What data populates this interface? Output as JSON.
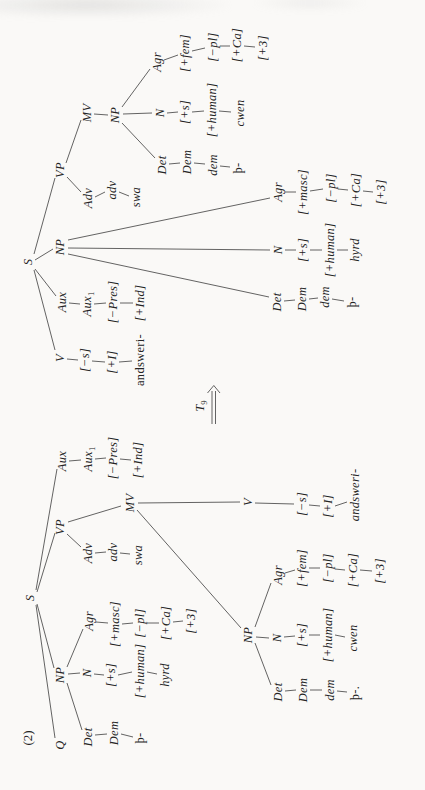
{
  "figure": {
    "example_label": "(2)",
    "transform": {
      "base": "T",
      "sub": "9"
    },
    "colors": {
      "ink": "#242424",
      "line": "#3c3c3c",
      "paper": "#faf9f7"
    }
  },
  "tree1": {
    "nodes": [
      {
        "t": "S",
        "x": 192,
        "y": 30
      },
      {
        "t": "Q",
        "x": 45,
        "y": 60
      },
      {
        "t": "NP",
        "x": 115,
        "y": 60
      },
      {
        "t": "VP",
        "x": 263,
        "y": 60
      },
      {
        "t": "Aux",
        "x": 329,
        "y": 62
      },
      {
        "t": "Aux",
        "sub": "1",
        "x": 331,
        "y": 88
      },
      {
        "t": "[−Pres]",
        "x": 332,
        "y": 113
      },
      {
        "t": "[+Ind]",
        "x": 330,
        "y": 138
      },
      {
        "t": "Det",
        "x": 53,
        "y": 88
      },
      {
        "t": "Dem",
        "x": 57,
        "y": 114
      },
      {
        "t": "þ-",
        "f": "rm",
        "x": 52,
        "y": 140
      },
      {
        "t": "N",
        "x": 117,
        "y": 87
      },
      {
        "t": "[+s]",
        "x": 115,
        "y": 111
      },
      {
        "t": "[+human]",
        "x": 119,
        "y": 140
      },
      {
        "t": "hyrd",
        "x": 115,
        "y": 165
      },
      {
        "t": "Agr",
        "x": 169,
        "y": 89
      },
      {
        "t": "[+masc]",
        "x": 166,
        "y": 115
      },
      {
        "t": "[−pl]",
        "x": 167,
        "y": 140
      },
      {
        "t": "[+Ca]",
        "x": 167,
        "y": 166
      },
      {
        "t": "[+3]",
        "x": 169,
        "y": 191
      },
      {
        "t": "Adv",
        "x": 237,
        "y": 88
      },
      {
        "t": "adv",
        "x": 238,
        "y": 113
      },
      {
        "t": "swa",
        "x": 235,
        "y": 138
      },
      {
        "t": "MV",
        "x": 287,
        "y": 130
      },
      {
        "t": "NP",
        "x": 155,
        "y": 248
      },
      {
        "t": "V",
        "x": 288,
        "y": 248
      },
      {
        "t": "[−s]",
        "x": 286,
        "y": 302
      },
      {
        "t": "[+I]",
        "x": 284,
        "y": 328
      },
      {
        "t": "andsweri-",
        "x": 295,
        "y": 355
      },
      {
        "t": "Det",
        "x": 98,
        "y": 278
      },
      {
        "t": "Dem",
        "x": 100,
        "y": 303
      },
      {
        "t": "dem",
        "x": 100,
        "y": 330
      },
      {
        "t": "þ-.",
        "f": "rm",
        "x": 97,
        "y": 355
      },
      {
        "t": "N",
        "x": 152,
        "y": 277
      },
      {
        "t": "[+s]",
        "x": 155,
        "y": 302
      },
      {
        "t": "[+human]",
        "x": 155,
        "y": 328
      },
      {
        "t": "cwen",
        "x": 152,
        "y": 353
      },
      {
        "t": "Agr",
        "x": 215,
        "y": 278
      },
      {
        "t": "[+fem]",
        "x": 222,
        "y": 302
      },
      {
        "t": "[−pl]",
        "x": 222,
        "y": 328
      },
      {
        "t": "[+Ca]",
        "x": 220,
        "y": 353
      },
      {
        "t": "[+3]",
        "x": 219,
        "y": 380
      }
    ],
    "edges": [
      [
        185,
        36,
        52,
        55
      ],
      [
        186,
        37,
        122,
        54
      ],
      [
        198,
        37,
        257,
        55
      ],
      [
        200,
        36,
        321,
        57
      ],
      [
        107,
        67,
        60,
        82
      ],
      [
        116,
        68,
        117,
        80
      ],
      [
        123,
        67,
        161,
        83
      ],
      [
        55,
        95,
        56,
        107
      ],
      [
        56,
        121,
        53,
        133
      ],
      [
        116,
        94,
        115,
        104
      ],
      [
        115,
        118,
        118,
        132
      ],
      [
        118,
        147,
        116,
        157
      ],
      [
        168,
        96,
        167,
        108
      ],
      [
        166,
        122,
        167,
        133
      ],
      [
        167,
        147,
        167,
        159
      ],
      [
        168,
        173,
        169,
        183
      ],
      [
        256,
        67,
        243,
        81
      ],
      [
        268,
        68,
        284,
        121
      ],
      [
        237,
        95,
        238,
        106
      ],
      [
        237,
        120,
        236,
        130
      ],
      [
        329,
        69,
        330,
        81
      ],
      [
        331,
        95,
        332,
        106
      ],
      [
        331,
        120,
        330,
        131
      ],
      [
        280,
        137,
        162,
        241
      ],
      [
        287,
        138,
        288,
        240
      ],
      [
        147,
        255,
        105,
        271
      ],
      [
        153,
        256,
        152,
        269
      ],
      [
        163,
        255,
        207,
        271
      ],
      [
        99,
        285,
        100,
        296
      ],
      [
        100,
        310,
        100,
        322
      ],
      [
        99,
        337,
        98,
        347
      ],
      [
        153,
        284,
        154,
        295
      ],
      [
        155,
        309,
        155,
        320
      ],
      [
        155,
        335,
        153,
        345
      ],
      [
        217,
        285,
        220,
        295
      ],
      [
        222,
        309,
        222,
        320
      ],
      [
        221,
        335,
        220,
        345
      ],
      [
        220,
        360,
        219,
        372
      ],
      [
        287,
        255,
        286,
        294
      ],
      [
        285,
        309,
        284,
        320
      ],
      [
        284,
        335,
        288,
        347
      ]
    ]
  },
  "tree2": {
    "nodes": [
      {
        "t": "S",
        "x": 528,
        "y": 28
      },
      {
        "t": "V",
        "x": 432,
        "y": 60
      },
      {
        "t": "[−s]",
        "x": 430,
        "y": 85
      },
      {
        "t": "[+I]",
        "x": 428,
        "y": 112
      },
      {
        "t": "andsweri-",
        "f": "rm",
        "x": 430,
        "y": 140
      },
      {
        "t": "Aux",
        "x": 488,
        "y": 62
      },
      {
        "t": "Aux",
        "sub": "1",
        "x": 486,
        "y": 87
      },
      {
        "t": "[−Pres]",
        "x": 488,
        "y": 113
      },
      {
        "t": "[+Ind]",
        "x": 487,
        "y": 140
      },
      {
        "t": "NP",
        "x": 543,
        "y": 60
      },
      {
        "t": "VP",
        "x": 620,
        "y": 60
      },
      {
        "t": "Adv",
        "x": 592,
        "y": 88
      },
      {
        "t": "adv",
        "x": 600,
        "y": 112
      },
      {
        "t": "swa",
        "x": 593,
        "y": 136
      },
      {
        "t": "MV",
        "x": 677,
        "y": 87
      },
      {
        "t": "NP",
        "x": 675,
        "y": 115
      },
      {
        "t": "Det",
        "x": 625,
        "y": 162
      },
      {
        "t": "Dem",
        "x": 628,
        "y": 187
      },
      {
        "t": "dem",
        "x": 625,
        "y": 213
      },
      {
        "t": "þ-",
        "f": "rm",
        "x": 622,
        "y": 238
      },
      {
        "t": "N",
        "x": 677,
        "y": 160
      },
      {
        "t": "[+s]",
        "x": 678,
        "y": 185
      },
      {
        "t": "[+human]",
        "x": 680,
        "y": 212
      },
      {
        "t": "cwen",
        "x": 677,
        "y": 240
      },
      {
        "t": "Agr",
        "x": 728,
        "y": 157
      },
      {
        "t": "[+fem]",
        "x": 737,
        "y": 185
      },
      {
        "t": "[−pl]",
        "x": 743,
        "y": 213
      },
      {
        "t": "[+Ca]",
        "x": 745,
        "y": 237
      },
      {
        "t": "[+3]",
        "x": 742,
        "y": 263
      },
      {
        "t": "Det",
        "x": 488,
        "y": 277
      },
      {
        "t": "Dem",
        "x": 491,
        "y": 302
      },
      {
        "t": "dem",
        "x": 493,
        "y": 325
      },
      {
        "t": "þ-",
        "f": "rm",
        "x": 488,
        "y": 352
      },
      {
        "t": "N",
        "x": 540,
        "y": 278
      },
      {
        "t": "[+s]",
        "x": 540,
        "y": 303
      },
      {
        "t": "[+human]",
        "x": 540,
        "y": 330
      },
      {
        "t": "hyrd",
        "x": 540,
        "y": 355
      },
      {
        "t": "Agr",
        "x": 598,
        "y": 278
      },
      {
        "t": "[+masc]",
        "x": 598,
        "y": 303
      },
      {
        "t": "[−pl]",
        "x": 602,
        "y": 331
      },
      {
        "t": "[+Ca]",
        "x": 600,
        "y": 356
      },
      {
        "t": "[+3]",
        "x": 598,
        "y": 381
      }
    ],
    "edges": [
      [
        520,
        34,
        440,
        55
      ],
      [
        521,
        35,
        494,
        56
      ],
      [
        530,
        35,
        541,
        53
      ],
      [
        536,
        34,
        612,
        55
      ],
      [
        431,
        67,
        430,
        78
      ],
      [
        429,
        92,
        428,
        105
      ],
      [
        428,
        119,
        429,
        132
      ],
      [
        487,
        69,
        486,
        80
      ],
      [
        486,
        94,
        487,
        106
      ],
      [
        487,
        120,
        487,
        133
      ],
      [
        536,
        68,
        493,
        269
      ],
      [
        542,
        68,
        540,
        270
      ],
      [
        550,
        68,
        592,
        270
      ],
      [
        613,
        67,
        598,
        81
      ],
      [
        627,
        66,
        670,
        81
      ],
      [
        593,
        95,
        598,
        105
      ],
      [
        598,
        119,
        594,
        129
      ],
      [
        676,
        94,
        675,
        108
      ],
      [
        667,
        122,
        632,
        155
      ],
      [
        676,
        123,
        677,
        152
      ],
      [
        683,
        122,
        721,
        150
      ],
      [
        626,
        169,
        627,
        180
      ],
      [
        627,
        194,
        626,
        205
      ],
      [
        624,
        220,
        623,
        230
      ],
      [
        677,
        167,
        678,
        178
      ],
      [
        678,
        192,
        679,
        204
      ],
      [
        679,
        219,
        678,
        231
      ],
      [
        730,
        164,
        735,
        178
      ],
      [
        739,
        192,
        742,
        205
      ],
      [
        744,
        220,
        744,
        230
      ],
      [
        744,
        244,
        743,
        255
      ],
      [
        489,
        284,
        490,
        295
      ],
      [
        491,
        309,
        492,
        318
      ],
      [
        491,
        332,
        489,
        344
      ],
      [
        540,
        285,
        540,
        296
      ],
      [
        540,
        310,
        540,
        322
      ],
      [
        540,
        337,
        540,
        348
      ],
      [
        598,
        285,
        598,
        296
      ],
      [
        599,
        310,
        601,
        323
      ],
      [
        601,
        338,
        600,
        348
      ],
      [
        599,
        363,
        598,
        373
      ]
    ]
  },
  "arrow": {
    "label_x": 384,
    "label_y": 200,
    "shaft": [
      [
        366,
        212,
        399,
        212
      ],
      [
        366,
        215.5,
        399,
        215.5
      ]
    ],
    "head": [
      [
        397,
        207.5,
        404.5,
        213.8
      ],
      [
        397,
        220,
        404.5,
        213.8
      ]
    ]
  }
}
